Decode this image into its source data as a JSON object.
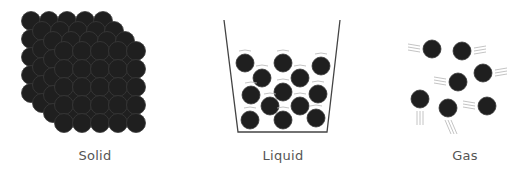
{
  "labels": {
    "solid": "Solid",
    "liquid": "Liquid",
    "gas": "Gas"
  },
  "colors": {
    "particle": "#1f1f1f",
    "particle_edge": "#3a3a3a",
    "container": "#444444",
    "motion_lines": "#b5b5b5",
    "label": "#555555"
  },
  "solid": {
    "rows": 5,
    "cols": 5,
    "layers": 4,
    "origin": [
      31,
      21
    ],
    "spacing": 18,
    "layer_offset": [
      11,
      10
    ],
    "radius": 9.5
  },
  "liquid": {
    "container": [
      [
        224,
        20
      ],
      [
        238,
        132
      ],
      [
        327,
        132
      ],
      [
        340,
        20
      ]
    ],
    "particles": [
      [
        245,
        63
      ],
      [
        283,
        63
      ],
      [
        321,
        66
      ],
      [
        262,
        78
      ],
      [
        300,
        78
      ],
      [
        251,
        95
      ],
      [
        283,
        92
      ],
      [
        318,
        94
      ],
      [
        270,
        106
      ],
      [
        300,
        106
      ],
      [
        250,
        120
      ],
      [
        283,
        120
      ],
      [
        316,
        118
      ]
    ],
    "radius": 9
  },
  "gas": {
    "particles": [
      {
        "x": 432,
        "y": 49,
        "trail": "left"
      },
      {
        "x": 462,
        "y": 51,
        "trail": "right"
      },
      {
        "x": 483,
        "y": 73,
        "trail": "right"
      },
      {
        "x": 458,
        "y": 82,
        "trail": "left"
      },
      {
        "x": 420,
        "y": 99,
        "trail": "down"
      },
      {
        "x": 448,
        "y": 108,
        "trail": "down-right"
      },
      {
        "x": 487,
        "y": 106,
        "trail": "left"
      }
    ],
    "radius": 9
  }
}
